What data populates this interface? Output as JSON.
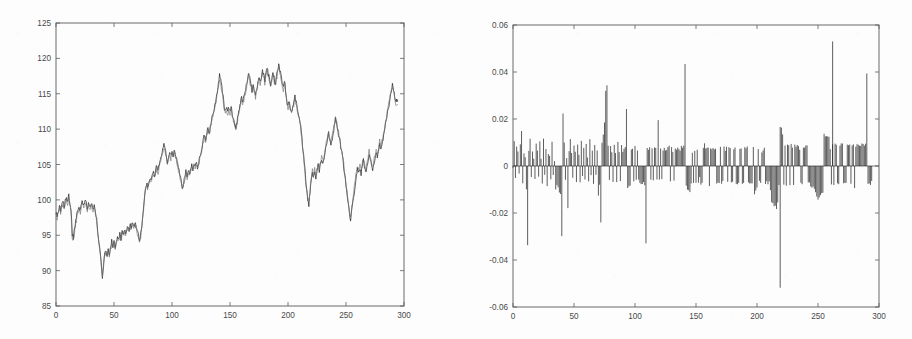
{
  "figure": {
    "background_color": "#fdfdfd",
    "axis_color": "#5a5a5a",
    "panels": [
      "left-price-series",
      "right-residual-series"
    ]
  },
  "chart_data": [
    {
      "id": "left",
      "type": "line",
      "title": "",
      "xlabel": "",
      "ylabel": "",
      "xlim": [
        0,
        300
      ],
      "ylim": [
        85,
        125
      ],
      "xticks": [
        0,
        50,
        100,
        150,
        200,
        250,
        300
      ],
      "xticklabels": [
        "0",
        "50",
        "100",
        "150",
        "200",
        "250",
        "300"
      ],
      "yticks": [
        85,
        90,
        95,
        100,
        105,
        110,
        115,
        120,
        125
      ],
      "yticklabels": [
        "85",
        "90",
        "95",
        "100",
        "105",
        "110",
        "115",
        "120",
        "125"
      ],
      "grid": false,
      "legend": null,
      "series": [
        {
          "name": "observed",
          "color": "#2b2b2b",
          "values": [
            98.1,
            97.6,
            98.4,
            99.0,
            98.3,
            99.2,
            99.7,
            99.1,
            99.9,
            100.4,
            99.8,
            100.5,
            99.6,
            98.6,
            95.0,
            94.6,
            95.8,
            96.9,
            97.8,
            98.4,
            99.1,
            98.6,
            99.4,
            99.8,
            99.3,
            99.9,
            99.5,
            98.9,
            99.4,
            99.0,
            99.5,
            99.2,
            98.8,
            99.1,
            98.5,
            97.2,
            95.6,
            94.0,
            92.6,
            91.0,
            89.1,
            90.6,
            92.4,
            93.1,
            92.3,
            93.0,
            92.5,
            93.4,
            94.1,
            93.6,
            94.0,
            93.4,
            94.2,
            94.8,
            94.3,
            95.1,
            94.6,
            95.4,
            95.0,
            95.7,
            95.2,
            95.9,
            96.3,
            95.8,
            96.6,
            96.1,
            96.8,
            96.2,
            96.9,
            96.4,
            95.6,
            94.9,
            94.2,
            95.1,
            96.4,
            98.2,
            100.1,
            101.6,
            102.3,
            101.8,
            102.6,
            103.1,
            102.5,
            103.4,
            103.9,
            103.3,
            104.2,
            104.8,
            104.2,
            105.1,
            105.7,
            106.4,
            107.2,
            108.0,
            107.1,
            106.2,
            105.4,
            106.1,
            106.8,
            106.1,
            106.9,
            106.3,
            107.0,
            106.4,
            105.7,
            104.9,
            104.1,
            103.4,
            102.6,
            101.8,
            102.5,
            103.2,
            104.0,
            103.4,
            104.1,
            103.5,
            104.3,
            105.0,
            104.4,
            105.2,
            104.6,
            105.3,
            104.7,
            105.4,
            106.1,
            106.8,
            107.6,
            108.4,
            109.2,
            108.6,
            109.4,
            110.1,
            109.5,
            110.3,
            111.1,
            111.9,
            112.7,
            113.5,
            114.4,
            115.3,
            116.2,
            117.8,
            116.9,
            115.8,
            114.6,
            113.4,
            112.5,
            113.2,
            112.4,
            113.1,
            112.3,
            113.0,
            112.2,
            111.6,
            110.8,
            110.1,
            111.0,
            112.1,
            113.0,
            113.8,
            114.6,
            113.7,
            114.5,
            115.3,
            116.1,
            117.0,
            117.9,
            117.1,
            116.3,
            115.5,
            116.4,
            115.6,
            114.8,
            115.7,
            116.5,
            117.4,
            116.6,
            117.5,
            118.4,
            117.6,
            116.8,
            117.7,
            118.6,
            117.8,
            117.0,
            116.2,
            117.1,
            118.0,
            117.2,
            116.4,
            117.3,
            118.2,
            119.1,
            118.3,
            117.5,
            116.7,
            115.9,
            116.8,
            115.4,
            114.2,
            113.1,
            113.9,
            113.2,
            112.4,
            113.1,
            113.8,
            114.6,
            113.8,
            113.0,
            112.2,
            111.4,
            110.2,
            108.6,
            106.9,
            105.2,
            103.4,
            101.6,
            100.1,
            99.3,
            101.0,
            102.6,
            103.9,
            103.1,
            104.0,
            103.2,
            104.1,
            105.0,
            104.2,
            105.1,
            105.9,
            105.1,
            106.0,
            106.9,
            107.8,
            108.6,
            109.4,
            108.6,
            107.8,
            108.7,
            109.6,
            110.5,
            111.4,
            110.6,
            109.8,
            108.9,
            108.0,
            107.0,
            106.0,
            104.8,
            103.5,
            102.1,
            100.7,
            99.4,
            98.2,
            97.1,
            98.4,
            99.7,
            101.0,
            102.3,
            103.6,
            104.4,
            103.6,
            104.5,
            103.7,
            104.6,
            105.5,
            104.7,
            103.9,
            104.8,
            105.7,
            106.6,
            105.8,
            105.0,
            104.2,
            105.1,
            106.0,
            106.9,
            106.1,
            107.0,
            107.9,
            106.9,
            107.8,
            108.7,
            109.6,
            110.5,
            111.4,
            112.4,
            113.4,
            114.4,
            115.4,
            116.4,
            115.6,
            114.8,
            114.0,
            113.8
          ]
        },
        {
          "name": "fitted",
          "color": "#6d6d6d",
          "offset_note": "near-identical second trace, small tracking error",
          "values": [
            97.7,
            97.3,
            98.1,
            98.6,
            98.1,
            98.9,
            99.4,
            98.9,
            99.6,
            100.1,
            99.5,
            100.2,
            99.3,
            98.2,
            94.7,
            94.3,
            95.5,
            96.6,
            97.5,
            98.1,
            98.8,
            98.3,
            99.1,
            99.5,
            99.0,
            99.6,
            99.2,
            98.6,
            99.1,
            98.7,
            99.2,
            98.9,
            98.5,
            98.8,
            98.2,
            96.9,
            95.3,
            93.7,
            92.3,
            90.7,
            89.5,
            90.9,
            92.1,
            92.8,
            92.0,
            92.7,
            92.2,
            93.1,
            93.8,
            93.3,
            93.7,
            93.1,
            93.9,
            94.5,
            94.0,
            94.8,
            94.3,
            95.1,
            94.7,
            95.4,
            94.9,
            95.6,
            96.0,
            95.5,
            96.3,
            95.8,
            96.5,
            95.9,
            96.6,
            96.1,
            95.3,
            94.6,
            93.9,
            94.8,
            96.1,
            97.9,
            99.8,
            101.3,
            102.0,
            101.5,
            102.3,
            102.8,
            102.2,
            103.1,
            103.6,
            103.0,
            103.9,
            104.5,
            103.9,
            104.8,
            105.4,
            106.1,
            106.9,
            107.6,
            106.8,
            105.9,
            105.1,
            105.8,
            106.5,
            105.8,
            106.6,
            106.0,
            106.7,
            106.1,
            105.4,
            104.6,
            103.8,
            103.1,
            102.3,
            101.5,
            102.2,
            102.9,
            103.7,
            103.1,
            103.8,
            103.2,
            104.0,
            104.7,
            104.1,
            104.9,
            104.3,
            105.0,
            104.4,
            105.1,
            105.8,
            106.5,
            107.3,
            108.1,
            108.9,
            108.3,
            109.1,
            109.8,
            109.2,
            110.0,
            110.8,
            111.6,
            112.4,
            113.2,
            114.1,
            115.0,
            115.9,
            117.2,
            116.4,
            115.4,
            114.3,
            113.1,
            112.2,
            112.9,
            112.1,
            112.8,
            112.0,
            112.7,
            111.9,
            111.3,
            110.5,
            109.8,
            110.7,
            111.8,
            112.7,
            113.5,
            114.3,
            113.4,
            114.2,
            115.0,
            115.8,
            116.7,
            117.6,
            116.8,
            116.0,
            115.2,
            116.1,
            115.3,
            114.5,
            115.4,
            116.2,
            117.1,
            116.3,
            117.2,
            118.1,
            117.3,
            116.5,
            117.4,
            118.3,
            117.5,
            116.7,
            115.9,
            116.8,
            117.7,
            116.9,
            116.1,
            117.0,
            117.9,
            118.8,
            118.0,
            117.2,
            116.4,
            115.6,
            116.5,
            115.1,
            113.9,
            112.8,
            113.6,
            112.9,
            112.1,
            112.8,
            113.5,
            114.3,
            113.5,
            112.7,
            111.9,
            111.1,
            109.9,
            108.3,
            106.6,
            104.9,
            103.1,
            101.4,
            100.5,
            99.8,
            101.4,
            103.0,
            104.2,
            103.4,
            104.3,
            103.5,
            104.4,
            105.3,
            104.5,
            105.4,
            106.2,
            105.4,
            106.3,
            107.2,
            108.1,
            108.9,
            109.7,
            108.9,
            108.1,
            109.0,
            109.9,
            110.8,
            111.7,
            110.9,
            110.1,
            109.2,
            108.3,
            107.3,
            106.3,
            105.1,
            103.8,
            102.4,
            101.0,
            99.7,
            98.5,
            97.6,
            98.9,
            100.2,
            101.5,
            102.8,
            104.0,
            104.8,
            104.0,
            104.9,
            104.1,
            105.0,
            105.9,
            105.1,
            104.3,
            105.2,
            106.1,
            107.0,
            106.2,
            105.4,
            104.6,
            105.5,
            106.4,
            107.3,
            106.5,
            107.4,
            108.3,
            107.3,
            108.2,
            109.1,
            110.0,
            110.9,
            111.8,
            112.8,
            113.8,
            114.8,
            115.8,
            116.0,
            115.2,
            114.4,
            113.6,
            113.4
          ]
        }
      ]
    },
    {
      "id": "right",
      "type": "bar",
      "title": "",
      "xlabel": "",
      "ylabel": "",
      "xlim": [
        0,
        300
      ],
      "ylim": [
        -0.06,
        0.06
      ],
      "xticks": [
        0,
        50,
        100,
        150,
        200,
        250,
        300
      ],
      "xticklabels": [
        "0",
        "50",
        "100",
        "150",
        "200",
        "250",
        "300"
      ],
      "yticks": [
        -0.06,
        -0.04,
        -0.02,
        0,
        0.02,
        0.04,
        0.06
      ],
      "yticklabels": [
        "-0.06",
        "-0.04",
        "-0.02",
        "0",
        "0.02",
        "0.04",
        "0.06"
      ],
      "grid": false,
      "legend": null,
      "zero_reference_line": 0,
      "bar_color": "#1e1e1e",
      "values": [
        0.0,
        0.011,
        -0.0045,
        0.008,
        0.0062,
        -0.0038,
        0.009,
        0.0144,
        -0.007,
        0.0052,
        0.0045,
        -0.0092,
        -0.0332,
        0.0072,
        0.0118,
        -0.0055,
        0.006,
        0.0035,
        -0.0048,
        0.0088,
        0.0065,
        -0.0042,
        0.0102,
        0.0038,
        -0.007,
        0.0115,
        -0.003,
        0.0075,
        -0.0085,
        0.0058,
        0.0046,
        -0.0062,
        0.0098,
        -0.004,
        0.0022,
        -0.01,
        -0.0078,
        -0.009,
        -0.0105,
        -0.0112,
        -0.0302,
        0.0216,
        0.0095,
        -0.0056,
        0.004,
        -0.0186,
        0.0068,
        0.011,
        0.0048,
        -0.0055,
        0.0082,
        0.0058,
        -0.0065,
        0.009,
        0.0042,
        -0.0072,
        0.0105,
        -0.0038,
        0.0075,
        -0.005,
        0.0088,
        0.0035,
        -0.006,
        0.0118,
        -0.0045,
        0.0072,
        -0.008,
        0.0095,
        -0.0042,
        0.0065,
        -0.0128,
        -0.0075,
        -0.024,
        0.0098,
        0.014,
        0.0188,
        0.0312,
        0.0348,
        0.0082,
        -0.0058,
        0.009,
        0.0052,
        -0.0068,
        0.0096,
        0.0054,
        -0.0062,
        0.0102,
        0.006,
        -0.0058,
        0.0092,
        0.0066,
        0.0074,
        0.0086,
        0.025,
        -0.0088,
        -0.009,
        -0.0078,
        0.0072,
        0.0068,
        -0.0066,
        0.008,
        -0.0056,
        0.007,
        -0.006,
        -0.007,
        -0.008,
        -0.0082,
        -0.0072,
        -0.0085,
        -0.0332,
        0.0072,
        0.007,
        0.008,
        -0.006,
        0.007,
        -0.0058,
        0.0078,
        0.007,
        -0.006,
        0.0198,
        -0.0062,
        0.007,
        -0.0058,
        0.0068,
        0.007,
        0.0068,
        0.0076,
        0.0078,
        0.008,
        -0.0058,
        0.0078,
        0.0066,
        -0.0056,
        0.0074,
        0.0074,
        0.0074,
        0.0072,
        0.0072,
        0.008,
        0.0082,
        0.0084,
        0.043,
        -0.0078,
        -0.0096,
        -0.0105,
        -0.0108,
        -0.008,
        0.0064,
        -0.0072,
        0.0064,
        -0.0072,
        0.0064,
        -0.0072,
        -0.0054,
        -0.0072,
        -0.0064,
        0.0082,
        0.01,
        0.0082,
        0.0072,
        0.0072,
        -0.008,
        0.0072,
        0.0072,
        0.007,
        0.0078,
        0.0078,
        -0.007,
        -0.007,
        -0.007,
        0.008,
        -0.007,
        -0.007,
        0.008,
        0.007,
        0.0078,
        -0.007,
        0.0078,
        0.0078,
        -0.007,
        -0.007,
        0.0078,
        0.0078,
        -0.007,
        -0.007,
        -0.007,
        0.0078,
        0.0078,
        -0.007,
        -0.007,
        0.0078,
        0.0078,
        0.0078,
        -0.007,
        -0.007,
        -0.007,
        -0.007,
        0.0078,
        -0.0122,
        -0.0108,
        -0.0098,
        0.0072,
        -0.0062,
        -0.0072,
        0.0064,
        0.0064,
        0.0072,
        -0.0072,
        -0.0072,
        -0.0072,
        -0.0072,
        -0.011,
        -0.0148,
        -0.016,
        -0.0165,
        -0.0175,
        -0.018,
        -0.015,
        -0.0082,
        0.0172,
        0.016,
        0.0128,
        -0.008,
        0.0088,
        -0.0078,
        0.0088,
        0.0088,
        -0.0078,
        0.0088,
        0.0078,
        -0.0078,
        0.0088,
        0.0088,
        0.0088,
        0.008,
        0.0076,
        -0.0076,
        -0.0076,
        0.0084,
        0.0084,
        0.0084,
        0.0082,
        -0.0074,
        -0.0074,
        -0.0084,
        -0.0086,
        -0.0095,
        -0.0096,
        -0.0115,
        -0.0128,
        -0.0138,
        -0.014,
        -0.0132,
        -0.0122,
        -0.0112,
        0.0132,
        0.0132,
        0.0128,
        0.0128,
        0.0126,
        0.0078,
        -0.0078,
        0.0088,
        -0.0078,
        0.0088,
        0.0088,
        -0.0078,
        -0.0078,
        0.0088,
        0.0088,
        0.0088,
        -0.0078,
        -0.0078,
        -0.0078,
        0.0088,
        0.0088,
        0.0088,
        -0.0078,
        0.0088,
        0.0088,
        -0.0096,
        0.0088,
        0.0088,
        0.0088,
        0.009,
        0.009,
        0.0092,
        0.0092,
        0.0092,
        0.0092,
        0.039,
        -0.0078,
        -0.0078,
        -0.0078,
        -0.007
      ],
      "notable_extremes": {
        "max": 0.053,
        "max_index": 262,
        "min": -0.0518,
        "min_index": 219
      }
    }
  ]
}
